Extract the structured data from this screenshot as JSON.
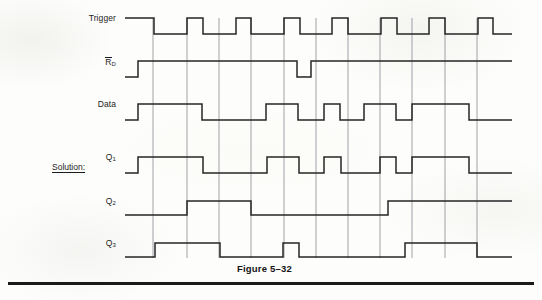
{
  "figure": {
    "caption": "Figure 5–32",
    "caption_x": 237,
    "caption_y": 263
  },
  "solution": {
    "label": "Solution:",
    "x": 52,
    "y": 162
  },
  "colors": {
    "ink": "#1c1c1c",
    "waveform": "#262626",
    "gridline": "#8a8a92",
    "page": "#fdfdfb",
    "rule": "#1a1a1a"
  },
  "geometry": {
    "wave_start_x": 125,
    "wave_end_x": 512,
    "grid_top_y": 18,
    "grid_bottom_y": 258,
    "gridlines_x": [
      153,
      187,
      219,
      251,
      284,
      316,
      348,
      380,
      412,
      445,
      477
    ],
    "period_px": 48.4,
    "stroke_width": 1.5,
    "grid_stroke_width": 0.8
  },
  "bottom_rule": {
    "x": 8,
    "y": 282,
    "width": 526,
    "height": 3
  },
  "waveforms": [
    {
      "name": "trigger",
      "label": "Trigger",
      "label_x": 116,
      "label_y": 18,
      "has_overbar": false,
      "subscript": "",
      "high_y": 18,
      "low_y": 34,
      "lead_x": 125,
      "lead_level": "high",
      "description": "Seven negative-going clock pulses",
      "transitions": [
        {
          "x": 154,
          "to": "low"
        },
        {
          "x": 187,
          "to": "high"
        },
        {
          "x": 203,
          "to": "low"
        },
        {
          "x": 236,
          "to": "high"
        },
        {
          "x": 251,
          "to": "low"
        },
        {
          "x": 284,
          "to": "high"
        },
        {
          "x": 300,
          "to": "low"
        },
        {
          "x": 332,
          "to": "high"
        },
        {
          "x": 348,
          "to": "low"
        },
        {
          "x": 381,
          "to": "high"
        },
        {
          "x": 397,
          "to": "low"
        },
        {
          "x": 429,
          "to": "high"
        },
        {
          "x": 445,
          "to": "low"
        },
        {
          "x": 478,
          "to": "high"
        },
        {
          "x": 493,
          "to": "low"
        }
      ]
    },
    {
      "name": "rd",
      "label": "R",
      "label_x": 116,
      "label_y": 61,
      "has_overbar": true,
      "subscript": "D",
      "high_y": 61,
      "low_y": 77,
      "lead_x": 125,
      "lead_level": "low",
      "description": "Asynchronous reset, active low; mostly high with one brief low pulse",
      "transitions": [
        {
          "x": 138,
          "to": "high"
        },
        {
          "x": 297,
          "to": "low"
        },
        {
          "x": 311,
          "to": "high"
        }
      ]
    },
    {
      "name": "data",
      "label": "Data",
      "label_x": 116,
      "label_y": 104,
      "has_overbar": false,
      "subscript": "",
      "high_y": 104,
      "low_y": 120,
      "lead_x": 125,
      "lead_level": "low",
      "description": "Serial data input stream",
      "transitions": [
        {
          "x": 138,
          "to": "high"
        },
        {
          "x": 202,
          "to": "low"
        },
        {
          "x": 266,
          "to": "high"
        },
        {
          "x": 298,
          "to": "low"
        },
        {
          "x": 324,
          "to": "high"
        },
        {
          "x": 340,
          "to": "low"
        },
        {
          "x": 364,
          "to": "high"
        },
        {
          "x": 396,
          "to": "low"
        },
        {
          "x": 412,
          "to": "high"
        },
        {
          "x": 469,
          "to": "low"
        }
      ]
    },
    {
      "name": "q1",
      "label": "Q",
      "label_x": 116,
      "label_y": 157,
      "has_overbar": false,
      "subscript": "1",
      "high_y": 157,
      "low_y": 173,
      "lead_x": 125,
      "lead_level": "low",
      "description": "First stage shift register output",
      "transitions": [
        {
          "x": 138,
          "to": "high"
        },
        {
          "x": 203,
          "to": "low"
        },
        {
          "x": 267,
          "to": "high"
        },
        {
          "x": 299,
          "to": "low"
        },
        {
          "x": 324,
          "to": "high"
        },
        {
          "x": 341,
          "to": "low"
        },
        {
          "x": 380,
          "to": "high"
        },
        {
          "x": 396,
          "to": "low"
        },
        {
          "x": 412,
          "to": "high"
        },
        {
          "x": 469,
          "to": "low"
        }
      ]
    },
    {
      "name": "q2",
      "label": "Q",
      "label_x": 116,
      "label_y": 201,
      "has_overbar": false,
      "subscript": "2",
      "high_y": 201,
      "low_y": 215,
      "lead_x": 125,
      "lead_level": "low",
      "description": "Second stage shift register output",
      "transitions": [
        {
          "x": 187,
          "to": "high"
        },
        {
          "x": 251,
          "to": "low"
        },
        {
          "x": 388,
          "to": "high"
        }
      ]
    },
    {
      "name": "q3",
      "label": "Q",
      "label_x": 116,
      "label_y": 243,
      "has_overbar": false,
      "subscript": "3",
      "high_y": 243,
      "low_y": 257,
      "lead_x": 125,
      "lead_level": "low",
      "description": "Third stage shift register output",
      "transitions": [
        {
          "x": 155,
          "to": "high"
        },
        {
          "x": 220,
          "to": "low"
        },
        {
          "x": 283,
          "to": "high"
        },
        {
          "x": 299,
          "to": "low"
        },
        {
          "x": 405,
          "to": "high"
        },
        {
          "x": 477,
          "to": "low"
        }
      ]
    }
  ]
}
